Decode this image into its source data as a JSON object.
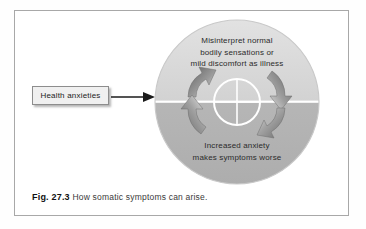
{
  "figure": {
    "caption_number": "Fig. 27.3",
    "caption_text": "How somatic symptoms can arise.",
    "input_label": "Health anxieties",
    "arrow_icon": "right-arrow-icon",
    "cycle_icon": "circular-arrows-icon",
    "crosshair_icon": "crosshair-circle-icon"
  },
  "cycle": {
    "top_lines": [
      "Misinterpret normal",
      "bodily sensations or",
      "mild discomfort as illness"
    ],
    "bottom_lines": [
      "Increased anxiety",
      "makes symptoms worse"
    ],
    "top_text": "Misinterpret normal bodily sensations or mild discomfort as illness",
    "bottom_text": "Increased anxiety makes symptoms worse"
  },
  "colors": {
    "circle_top_half": "#d9d9d9",
    "circle_bottom_half": "#b3b3b3",
    "divider_line": "#ffffff",
    "arrow_fill": "#8a8a8a",
    "frame_border": "#a8a8a8",
    "box_fill": "#f0f0f0",
    "text": "#2b2b2b"
  }
}
